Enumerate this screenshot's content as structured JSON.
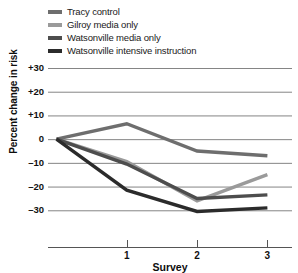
{
  "chart_data": {
    "type": "line",
    "title": "",
    "xlabel": "Survey",
    "ylabel": "Percent change in risk",
    "x": [
      0,
      1,
      2,
      3
    ],
    "xtick_labels": [
      "1",
      "2",
      "3"
    ],
    "xtick_values": [
      1,
      2,
      3
    ],
    "ytick_labels": [
      "+30",
      "+20",
      "+10",
      "0",
      "–10",
      "–20",
      "–30"
    ],
    "ytick_values": [
      30,
      20,
      10,
      0,
      -10,
      -20,
      -30
    ],
    "ylim": [
      -40,
      30
    ],
    "xlim": [
      -0.12,
      3.35
    ],
    "grid": "horizontal",
    "legend_position": "above-plot",
    "series": [
      {
        "name": "Tracy control",
        "color": "#6e6e6e",
        "values": [
          0,
          6.5,
          -5.0,
          -7.0
        ]
      },
      {
        "name": "Gilroy media only",
        "color": "#9a9a9a",
        "values": [
          0,
          -9.5,
          -26.0,
          -15.0
        ]
      },
      {
        "name": "Watsonville media only",
        "color": "#4d4d4d",
        "values": [
          0,
          -10.5,
          -25.0,
          -23.5
        ]
      },
      {
        "name": "Watsonville intensive instruction",
        "color": "#2b2b2b",
        "values": [
          0,
          -21.5,
          -30.5,
          -29.0
        ]
      }
    ]
  },
  "legend": {
    "items": [
      {
        "label": "Tracy control"
      },
      {
        "label": "Gilroy media only"
      },
      {
        "label": "Watsonville media only"
      },
      {
        "label": "Watsonville intensive instruction"
      }
    ]
  },
  "axes": {
    "y_title": "Percent change in risk",
    "x_title": "Survey"
  },
  "colors": {
    "background": "#ffffff",
    "gridline": "#777777",
    "axis": "#555555",
    "text": "#111111"
  }
}
